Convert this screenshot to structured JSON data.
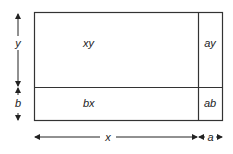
{
  "diagram": {
    "regions": {
      "top_left": "xy",
      "top_right": "ay",
      "bottom_left": "bx",
      "bottom_right": "ab"
    },
    "dimensions": {
      "vertical_top": "y",
      "vertical_bottom": "b",
      "horizontal_left": "x",
      "horizontal_right": "a"
    },
    "colors": {
      "stroke": "#333333",
      "text": "#222222",
      "background": "#ffffff"
    }
  }
}
